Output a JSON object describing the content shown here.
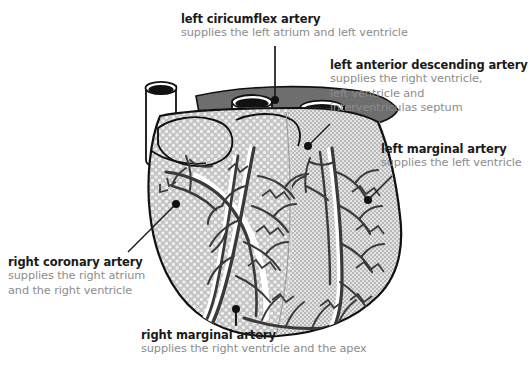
{
  "diagram": {
    "background_color": "#ffffff"
  },
  "labels": {
    "left_circumflex": {
      "title": "left ciricumflex artery",
      "subtitle": "supplies the left atrium and left ventricle"
    },
    "left_anterior_descending": {
      "title": "left anterior descending artery",
      "subtitle_line1": "supplies the right ventricle,",
      "subtitle_line2": "left ventricle and",
      "subtitle_line3": "interventriculas septum"
    },
    "left_marginal": {
      "title": "left marginal artery",
      "subtitle": "supplies the left ventricle"
    },
    "right_coronary": {
      "title": "right coronary artery",
      "subtitle_line1": "supplies the right atrium",
      "subtitle_line2": "and the right ventricle"
    },
    "right_marginal": {
      "title": "right marginal artery",
      "subtitle": "supplies the right ventricle and the apex"
    }
  },
  "colors": {
    "title_text": "#1a1a1a",
    "subtitle_text": "#8c8c8c",
    "outline": "#111111",
    "vessel": "#3a3a3a",
    "right_ventricle_fill": "#c9c9c9",
    "left_ventricle_fill": "#d7d7d7",
    "great_vessel_band": "#6e6e6e",
    "lumen": "#111111",
    "leader_line": "#1a1a1a"
  }
}
